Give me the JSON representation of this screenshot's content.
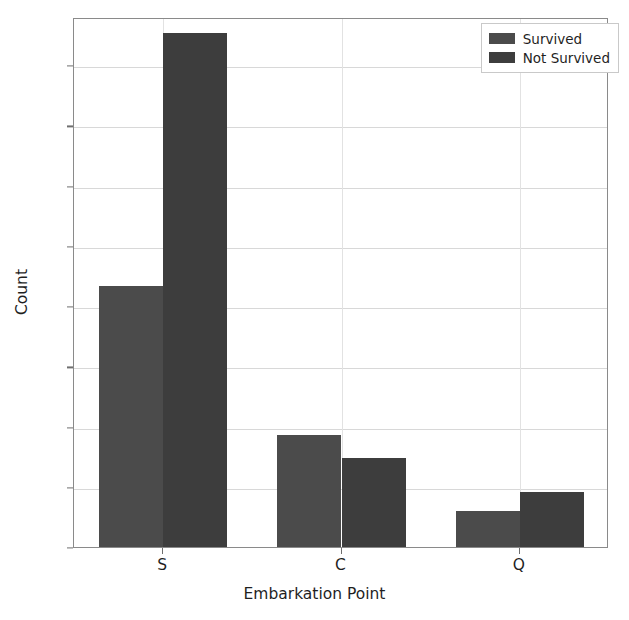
{
  "chart_data": {
    "type": "bar",
    "title": "",
    "xlabel": "Embarkation Point",
    "ylabel": "Count",
    "categories": [
      "S",
      "C",
      "Q"
    ],
    "series": [
      {
        "name": "Survived",
        "values": [
          217,
          93,
          30
        ],
        "color": "#4b4b4b"
      },
      {
        "name": "Not Survived",
        "values": [
          427,
          74,
          46
        ],
        "color": "#3d3d3d"
      }
    ],
    "ylim": [
      0,
      440
    ],
    "yticks": [
      0,
      50,
      100,
      150,
      200,
      250,
      300,
      350,
      400
    ],
    "ytick_labels": [
      "0",
      "50",
      "100",
      "150",
      "200",
      "250",
      "300",
      "350",
      "400"
    ],
    "grid": true,
    "legend_position": "upper right",
    "legend_entries": [
      "Survived",
      "Not Survived"
    ],
    "background_color": "#ffffff",
    "grid_color": "#d8d8d8",
    "axis_color": "#8a8a8a"
  }
}
